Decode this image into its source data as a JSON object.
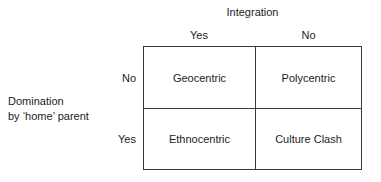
{
  "diagram": {
    "column_axis": {
      "title": "Integration",
      "headers": [
        "Yes",
        "No"
      ]
    },
    "row_axis": {
      "title_line1": "Domination",
      "title_line2": "by ‘home’ parent",
      "headers": [
        "No",
        "Yes"
      ]
    },
    "cells": [
      [
        "Geocentric",
        "Polycentric"
      ],
      [
        "Ethnocentric",
        "Culture Clash"
      ]
    ]
  },
  "chart_data": {
    "type": "table",
    "title": "",
    "xlabel": "Integration",
    "ylabel": "Domination by ‘home’ parent",
    "categories": [
      "Yes",
      "No"
    ],
    "row_categories": [
      "No",
      "Yes"
    ],
    "values": [
      [
        "Geocentric",
        "Polycentric"
      ],
      [
        "Ethnocentric",
        "Culture Clash"
      ]
    ],
    "grid": true,
    "legend": "none"
  }
}
